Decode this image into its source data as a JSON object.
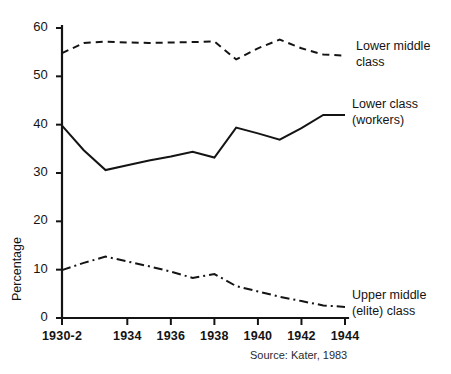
{
  "chart_data": {
    "type": "line",
    "title": "",
    "xlabel": "",
    "ylabel": "Percentage",
    "xlim": [
      1931,
      1944
    ],
    "ylim": [
      0,
      60
    ],
    "grid": false,
    "legend_position": "right-inline",
    "x": [
      1931,
      1932,
      1933,
      1934,
      1935,
      1936,
      1937,
      1938,
      1939,
      1940,
      1941,
      1942,
      1943,
      1944
    ],
    "xtick_labels": [
      "1930-2",
      "1934",
      "1936",
      "1938",
      "1940",
      "1942",
      "1944"
    ],
    "xtick_values": [
      1931,
      1934,
      1936,
      1938,
      1940,
      1942,
      1944
    ],
    "ytick_labels": [
      "0",
      "10",
      "20",
      "30",
      "40",
      "50",
      "60"
    ],
    "ytick_values": [
      0,
      10,
      20,
      30,
      40,
      50,
      60
    ],
    "series": [
      {
        "name": "Lower middle class",
        "label_lines": [
          "Lower middle",
          "class"
        ],
        "style": "dashed",
        "color": "#141414",
        "values": [
          54.8,
          56.9,
          57.2,
          57.0,
          56.9,
          57.0,
          57.1,
          57.2,
          53.5,
          55.8,
          57.6,
          55.8,
          54.5,
          54.3
        ]
      },
      {
        "name": "Lower class (workers)",
        "label_lines": [
          "Lower class",
          "(workers)"
        ],
        "style": "solid",
        "color": "#141414",
        "values": [
          39.8,
          34.7,
          30.6,
          31.6,
          32.6,
          33.4,
          34.4,
          33.2,
          39.4,
          38.2,
          36.9,
          39.3,
          42.0,
          42.0
        ]
      },
      {
        "name": "Upper middle (elite) class",
        "label_lines": [
          "Upper middle",
          "(elite) class"
        ],
        "style": "dashdot",
        "color": "#141414",
        "values": [
          9.9,
          11.4,
          12.7,
          11.7,
          10.7,
          9.6,
          8.3,
          9.1,
          6.6,
          5.5,
          4.4,
          3.5,
          2.6,
          2.3
        ]
      }
    ],
    "annotations": [
      {
        "name": "source",
        "text": "Source: Kater, 1983"
      }
    ]
  },
  "axis": {
    "y_title": "Percentage"
  },
  "footer": {
    "source": "Source: Kater, 1983"
  }
}
